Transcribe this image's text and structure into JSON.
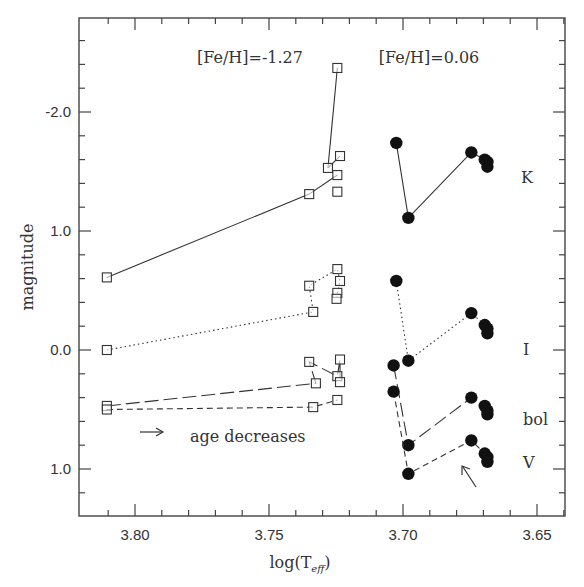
{
  "chart_data": {
    "type": "line",
    "title": "",
    "xlabel": "log(T_eff)",
    "xlabel_main": "log(T",
    "xlabel_sub": "eff",
    "xlabel_close": ")",
    "ylabel": "magnitude",
    "xlim": [
      3.821,
      3.639
    ],
    "ylim": [
      1.39,
      -2.8
    ],
    "y_inverted": true,
    "x_inverted": true,
    "grid": false,
    "x_ticks": [
      {
        "value": 3.8,
        "label": "3.80"
      },
      {
        "value": 3.75,
        "label": "3.75"
      },
      {
        "value": 3.7,
        "label": "3.70"
      },
      {
        "value": 3.65,
        "label": "3.65"
      }
    ],
    "y_ticks": [
      {
        "value": -2.0,
        "label": "-2.0"
      },
      {
        "value": -1.0,
        "label": "1.0"
      },
      {
        "value": 0.0,
        "label": "0.0"
      },
      {
        "value": 1.0,
        "label": "1.0"
      }
    ],
    "annotations": [
      {
        "text": "[Fe/H]=-1.27",
        "x": 3.763,
        "y": -2.6
      },
      {
        "text": "[Fe/H]=0.06",
        "x": 3.683,
        "y": -2.6
      },
      {
        "text": "K",
        "x": 3.658,
        "y": -1.5
      },
      {
        "text": "I",
        "x": 3.658,
        "y": -0.25
      },
      {
        "text": "bol",
        "x": 3.658,
        "y": 0.6
      },
      {
        "text": "V",
        "x": 3.658,
        "y": 0.95
      },
      {
        "text": "age decreases",
        "x": 3.773,
        "y": 0.71
      },
      {
        "text": "→",
        "x": 3.79,
        "y": 0.64
      },
      {
        "text": "↖",
        "x": 3.677,
        "y": 0.92
      }
    ],
    "series": [
      {
        "name": "K [Fe/H]=-1.27",
        "band": "K",
        "metallicity": -1.27,
        "marker": "open-square",
        "line": "solid",
        "x": [
          3.8105,
          3.7245,
          3.728,
          3.735,
          3.7235,
          3.7245
        ],
        "y": [
          -0.61,
          -2.37,
          -1.53,
          -1.31,
          -1.63,
          -1.47
        ],
        "segments": [
          [
            0,
            3
          ],
          [
            3,
            5
          ],
          [
            2,
            1
          ],
          [
            2,
            4
          ]
        ]
      },
      {
        "name": "K1 extra",
        "band": "K",
        "metallicity": -1.27,
        "marker": "open-square",
        "line": "none",
        "x": [
          3.7245
        ],
        "y": [
          -1.33
        ]
      },
      {
        "name": "I [Fe/H]=-1.27",
        "band": "I",
        "metallicity": -1.27,
        "marker": "open-square",
        "line": "dotted",
        "x": [
          3.8105,
          3.7335,
          3.735,
          3.7245,
          3.7235,
          3.7245,
          3.7248
        ],
        "y": [
          0.0,
          -0.32,
          -0.54,
          -0.68,
          -0.58,
          -0.48,
          -0.43
        ]
      },
      {
        "name": "bol [Fe/H]=-1.27",
        "band": "bol",
        "metallicity": -1.27,
        "marker": "open-square",
        "line": "long-dash",
        "x": [
          3.8105,
          3.7325,
          3.735,
          3.7245,
          3.7235,
          3.7235
        ],
        "y": [
          0.47,
          0.28,
          0.1,
          0.22,
          0.08,
          0.27
        ]
      },
      {
        "name": "V [Fe/H]=-1.27",
        "band": "V",
        "metallicity": -1.27,
        "marker": "open-square",
        "line": "short-dash",
        "x": [
          3.8105,
          3.7335,
          3.7245
        ],
        "y": [
          0.5,
          0.48,
          0.42
        ]
      },
      {
        "name": "K [Fe/H]=0.06",
        "band": "K",
        "metallicity": 0.06,
        "marker": "filled-circle",
        "line": "solid",
        "x": [
          3.7025,
          3.698,
          3.6745,
          3.6695,
          3.6685,
          3.6685
        ],
        "y": [
          -1.74,
          -1.11,
          -1.66,
          -1.6,
          -1.58,
          -1.54
        ]
      },
      {
        "name": "I [Fe/H]=0.06",
        "band": "I",
        "metallicity": 0.06,
        "marker": "filled-circle",
        "line": "dotted",
        "x": [
          3.7025,
          3.698,
          3.6745,
          3.6695,
          3.6685,
          3.6685
        ],
        "y": [
          -0.58,
          0.09,
          -0.31,
          -0.21,
          -0.18,
          -0.14
        ]
      },
      {
        "name": "bol [Fe/H]=0.06",
        "band": "bol",
        "metallicity": 0.06,
        "marker": "filled-circle",
        "line": "long-dash",
        "x": [
          3.7035,
          3.698,
          3.6745,
          3.6695,
          3.6685,
          3.6685
        ],
        "y": [
          0.13,
          0.8,
          0.4,
          0.47,
          0.51,
          0.54
        ]
      },
      {
        "name": "V [Fe/H]=0.06",
        "band": "V",
        "metallicity": 0.06,
        "marker": "filled-circle",
        "line": "short-dash",
        "x": [
          3.7035,
          3.698,
          3.6745,
          3.6695,
          3.6685,
          3.6685
        ],
        "y": [
          0.35,
          1.04,
          0.76,
          0.87,
          0.9,
          0.94
        ]
      }
    ]
  }
}
